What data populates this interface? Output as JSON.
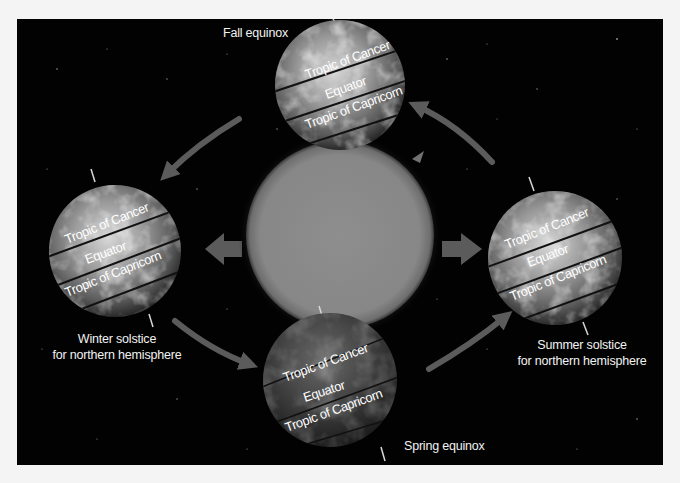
{
  "figure": {
    "background_color": "#020202",
    "sun": {
      "name": "Sun",
      "color": "#8a8a8a"
    },
    "arrow_color": "#5b5b5b"
  },
  "positions": {
    "fall": {
      "label": "Fall equinox",
      "lines": [
        "Tropic of Cancer",
        "Equator",
        "Tropic of Capricorn"
      ]
    },
    "winter": {
      "label_line1": "Winter solstice",
      "label_line2": "for northern hemisphere",
      "lines": [
        "Tropic of Cancer",
        "Equator",
        "Tropic of Capricorn"
      ]
    },
    "summer": {
      "label_line1": "Summer solstice",
      "label_line2": "for northern hemisphere",
      "lines": [
        "Tropic of Cancer",
        "Equator",
        "Tropic of Capricorn"
      ]
    },
    "spring": {
      "label": "Spring equinox",
      "lines": [
        "Tropic of Cancer",
        "Equator",
        "Tropic of Capricorn"
      ]
    }
  }
}
